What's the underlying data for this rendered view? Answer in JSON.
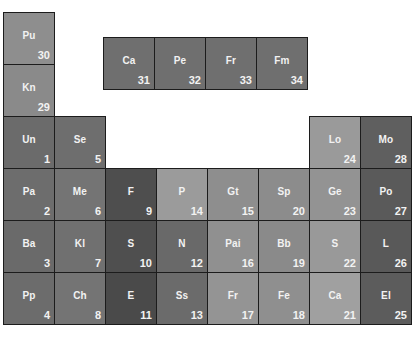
{
  "chart_data": {
    "type": "heatmap",
    "title": "",
    "cells": [
      {
        "symbol": "Pu",
        "number": 30,
        "x": 3,
        "y": 12,
        "color": "#8e8e8e"
      },
      {
        "symbol": "Kn",
        "number": 29,
        "x": 3,
        "y": 64,
        "color": "#8a8a8a"
      },
      {
        "symbol": "Ca",
        "number": 31,
        "x": 103,
        "y": 37,
        "color": "#6f6f6f"
      },
      {
        "symbol": "Pe",
        "number": 32,
        "x": 154,
        "y": 37,
        "color": "#6f6f6f"
      },
      {
        "symbol": "Fr",
        "number": 33,
        "x": 205,
        "y": 37,
        "color": "#6f6f6f"
      },
      {
        "symbol": "Fm",
        "number": 34,
        "x": 256,
        "y": 37,
        "color": "#6f6f6f"
      },
      {
        "symbol": "Un",
        "number": 1,
        "x": 3,
        "y": 116,
        "color": "#6b6b6b"
      },
      {
        "symbol": "Se",
        "number": 5,
        "x": 54,
        "y": 116,
        "color": "#6e6e6e"
      },
      {
        "symbol": "Lo",
        "number": 24,
        "x": 309,
        "y": 116,
        "color": "#9a9a9a"
      },
      {
        "symbol": "Mo",
        "number": 28,
        "x": 360,
        "y": 116,
        "color": "#5f5f5f"
      },
      {
        "symbol": "Pa",
        "number": 2,
        "x": 3,
        "y": 168,
        "color": "#6d6d6d"
      },
      {
        "symbol": "Me",
        "number": 6,
        "x": 54,
        "y": 168,
        "color": "#747474"
      },
      {
        "symbol": "F",
        "number": 9,
        "x": 105,
        "y": 168,
        "color": "#4e4e4e"
      },
      {
        "symbol": "P",
        "number": 14,
        "x": 156,
        "y": 168,
        "color": "#9b9b9b"
      },
      {
        "symbol": "Gt",
        "number": 15,
        "x": 207,
        "y": 168,
        "color": "#8e8e8e"
      },
      {
        "symbol": "Sp",
        "number": 20,
        "x": 258,
        "y": 168,
        "color": "#8c8c8c"
      },
      {
        "symbol": "Ge",
        "number": 23,
        "x": 309,
        "y": 168,
        "color": "#939393"
      },
      {
        "symbol": "Po",
        "number": 27,
        "x": 360,
        "y": 168,
        "color": "#5a5a5a"
      },
      {
        "symbol": "Ba",
        "number": 3,
        "x": 3,
        "y": 220,
        "color": "#6a6a6a"
      },
      {
        "symbol": "Kl",
        "number": 7,
        "x": 54,
        "y": 220,
        "color": "#707070"
      },
      {
        "symbol": "S",
        "number": 10,
        "x": 105,
        "y": 220,
        "color": "#4f4f4f"
      },
      {
        "symbol": "N",
        "number": 12,
        "x": 156,
        "y": 220,
        "color": "#696969"
      },
      {
        "symbol": "Pai",
        "number": 16,
        "x": 207,
        "y": 220,
        "color": "#909090"
      },
      {
        "symbol": "Bb",
        "number": 19,
        "x": 258,
        "y": 220,
        "color": "#8a8a8a"
      },
      {
        "symbol": "S",
        "number": 22,
        "x": 309,
        "y": 220,
        "color": "#999999"
      },
      {
        "symbol": "L",
        "number": 26,
        "x": 360,
        "y": 220,
        "color": "#595959"
      },
      {
        "symbol": "Pp",
        "number": 4,
        "x": 3,
        "y": 272,
        "color": "#6c6c6c"
      },
      {
        "symbol": "Ch",
        "number": 8,
        "x": 54,
        "y": 272,
        "color": "#747474"
      },
      {
        "symbol": "E",
        "number": 11,
        "x": 105,
        "y": 272,
        "color": "#4a4a4a"
      },
      {
        "symbol": "Ss",
        "number": 13,
        "x": 156,
        "y": 272,
        "color": "#6b6b6b"
      },
      {
        "symbol": "Fr",
        "number": 17,
        "x": 207,
        "y": 272,
        "color": "#949494"
      },
      {
        "symbol": "Fe",
        "number": 18,
        "x": 258,
        "y": 272,
        "color": "#8f8f8f"
      },
      {
        "symbol": "Ca",
        "number": 21,
        "x": 309,
        "y": 272,
        "color": "#a0a0a0"
      },
      {
        "symbol": "El",
        "number": 25,
        "x": 360,
        "y": 272,
        "color": "#5c5c5c"
      }
    ]
  }
}
